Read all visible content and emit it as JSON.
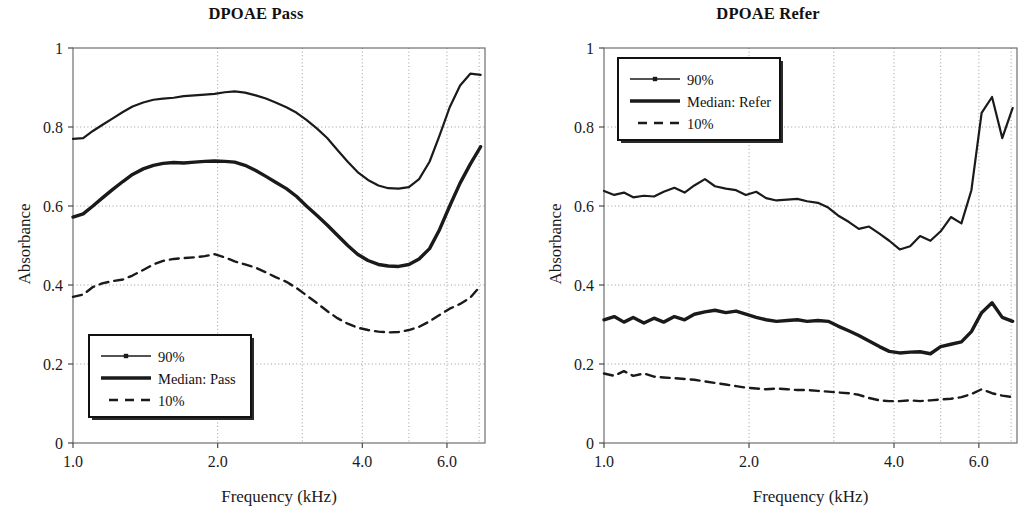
{
  "figure": {
    "width": 1025,
    "height": 512,
    "background": "#ffffff",
    "ink_color": "#1a1a1a",
    "grid_color": "#9a9a9a"
  },
  "panels": [
    {
      "id": "dpoae-pass",
      "title": "DPOAE Pass",
      "xlabel": "Frequency (kHz)",
      "ylabel": "Absorbance",
      "legend_position": "lower-left"
    },
    {
      "id": "dpoae-refer",
      "title": "DPOAE Refer",
      "xlabel": "Frequency (kHz)",
      "ylabel": "Absorbance",
      "legend_position": "upper-left"
    }
  ],
  "chart_data": [
    {
      "type": "line",
      "id": "dpoae-pass",
      "title": "DPOAE Pass",
      "xlabel": "Frequency (kHz)",
      "ylabel": "Absorbance",
      "xscale": "log",
      "xlim": [
        1.0,
        7.2
      ],
      "ylim": [
        0,
        1
      ],
      "xticks": [
        1.0,
        2.0,
        4.0,
        6.0
      ],
      "xticklabels": [
        "1.0",
        "2.0",
        "4.0",
        "6.0"
      ],
      "xgridlines": [
        2.0,
        3.0,
        4.0,
        5.0,
        6.0,
        7.0
      ],
      "yticks": [
        0,
        0.2,
        0.4,
        0.6,
        0.8,
        1
      ],
      "yticklabels": [
        "0",
        "0.2",
        "0.4",
        "0.6",
        "0.8",
        "1"
      ],
      "ygridlines": [
        0.2,
        0.4,
        0.6,
        0.8
      ],
      "grid": true,
      "legend": [
        {
          "label": "90%",
          "style": "solid-marker"
        },
        {
          "label": "Median: Pass",
          "style": "thick-solid"
        },
        {
          "label": "10%",
          "style": "dashed"
        }
      ],
      "x": [
        1.0,
        1.05,
        1.1,
        1.15,
        1.21,
        1.27,
        1.33,
        1.4,
        1.47,
        1.54,
        1.62,
        1.7,
        1.79,
        1.88,
        1.97,
        2.07,
        2.17,
        2.28,
        2.4,
        2.52,
        2.64,
        2.78,
        2.92,
        3.06,
        3.22,
        3.38,
        3.55,
        3.73,
        3.91,
        4.11,
        4.32,
        4.53,
        4.76,
        5.0,
        5.25,
        5.52,
        5.79,
        6.08,
        6.39,
        6.71,
        7.05
      ],
      "series": [
        {
          "name": "90%",
          "values": [
            0.77,
            0.772,
            0.79,
            0.805,
            0.822,
            0.838,
            0.852,
            0.862,
            0.869,
            0.872,
            0.874,
            0.878,
            0.88,
            0.882,
            0.884,
            0.888,
            0.89,
            0.887,
            0.88,
            0.872,
            0.862,
            0.85,
            0.836,
            0.818,
            0.796,
            0.772,
            0.742,
            0.712,
            0.686,
            0.666,
            0.652,
            0.645,
            0.644,
            0.648,
            0.668,
            0.712,
            0.778,
            0.85,
            0.905,
            0.935,
            0.932
          ]
        },
        {
          "name": "Median: Pass",
          "values": [
            0.572,
            0.58,
            0.6,
            0.62,
            0.642,
            0.662,
            0.68,
            0.694,
            0.703,
            0.708,
            0.71,
            0.709,
            0.711,
            0.713,
            0.714,
            0.713,
            0.711,
            0.703,
            0.69,
            0.675,
            0.66,
            0.644,
            0.624,
            0.6,
            0.576,
            0.552,
            0.526,
            0.5,
            0.478,
            0.462,
            0.452,
            0.448,
            0.447,
            0.452,
            0.466,
            0.492,
            0.54,
            0.6,
            0.658,
            0.706,
            0.75
          ]
        },
        {
          "name": "10%",
          "values": [
            0.37,
            0.376,
            0.395,
            0.404,
            0.41,
            0.414,
            0.424,
            0.438,
            0.452,
            0.461,
            0.466,
            0.468,
            0.47,
            0.473,
            0.478,
            0.47,
            0.46,
            0.452,
            0.444,
            0.432,
            0.42,
            0.408,
            0.392,
            0.374,
            0.354,
            0.334,
            0.316,
            0.302,
            0.292,
            0.286,
            0.282,
            0.28,
            0.281,
            0.286,
            0.294,
            0.308,
            0.324,
            0.34,
            0.352,
            0.368,
            0.398
          ]
        }
      ]
    },
    {
      "type": "line",
      "id": "dpoae-refer",
      "title": "DPOAE Refer",
      "xlabel": "Frequency (kHz)",
      "ylabel": "Absorbance",
      "xscale": "log",
      "xlim": [
        1.0,
        7.2
      ],
      "ylim": [
        0,
        1
      ],
      "xticks": [
        1.0,
        2.0,
        4.0,
        6.0
      ],
      "xticklabels": [
        "1.0",
        "2.0",
        "4.0",
        "6.0"
      ],
      "xgridlines": [
        2.0,
        3.0,
        4.0,
        5.0,
        6.0,
        7.0
      ],
      "yticks": [
        0,
        0.2,
        0.4,
        0.6,
        0.8,
        1
      ],
      "yticklabels": [
        "0",
        "0.2",
        "0.4",
        "0.6",
        "0.8",
        "1"
      ],
      "ygridlines": [
        0.2,
        0.4,
        0.6,
        0.8
      ],
      "grid": true,
      "legend": [
        {
          "label": "90%",
          "style": "solid-marker"
        },
        {
          "label": "Median: Refer",
          "style": "thick-solid"
        },
        {
          "label": "10%",
          "style": "dashed"
        }
      ],
      "x": [
        1.0,
        1.05,
        1.1,
        1.15,
        1.21,
        1.27,
        1.33,
        1.4,
        1.47,
        1.54,
        1.62,
        1.7,
        1.79,
        1.88,
        1.97,
        2.07,
        2.17,
        2.28,
        2.4,
        2.52,
        2.64,
        2.78,
        2.92,
        3.06,
        3.22,
        3.38,
        3.55,
        3.73,
        3.91,
        4.11,
        4.32,
        4.53,
        4.76,
        5.0,
        5.25,
        5.52,
        5.79,
        6.08,
        6.39,
        6.71,
        7.05
      ],
      "series": [
        {
          "name": "90%",
          "values": [
            0.638,
            0.628,
            0.634,
            0.622,
            0.626,
            0.624,
            0.636,
            0.646,
            0.634,
            0.652,
            0.668,
            0.65,
            0.644,
            0.64,
            0.628,
            0.636,
            0.62,
            0.614,
            0.616,
            0.618,
            0.612,
            0.608,
            0.596,
            0.576,
            0.56,
            0.542,
            0.548,
            0.53,
            0.512,
            0.49,
            0.498,
            0.524,
            0.512,
            0.536,
            0.572,
            0.556,
            0.64,
            0.836,
            0.876,
            0.772,
            0.848
          ]
        },
        {
          "name": "Median: Refer",
          "values": [
            0.312,
            0.32,
            0.306,
            0.318,
            0.304,
            0.316,
            0.306,
            0.32,
            0.312,
            0.326,
            0.332,
            0.336,
            0.33,
            0.334,
            0.326,
            0.318,
            0.312,
            0.308,
            0.31,
            0.312,
            0.308,
            0.31,
            0.308,
            0.296,
            0.284,
            0.272,
            0.258,
            0.244,
            0.232,
            0.228,
            0.23,
            0.231,
            0.226,
            0.244,
            0.25,
            0.256,
            0.282,
            0.33,
            0.355,
            0.318,
            0.308
          ]
        },
        {
          "name": "10%",
          "values": [
            0.176,
            0.17,
            0.182,
            0.17,
            0.176,
            0.168,
            0.166,
            0.164,
            0.162,
            0.16,
            0.156,
            0.152,
            0.148,
            0.144,
            0.14,
            0.138,
            0.136,
            0.138,
            0.136,
            0.134,
            0.134,
            0.132,
            0.13,
            0.128,
            0.126,
            0.122,
            0.114,
            0.108,
            0.106,
            0.106,
            0.108,
            0.106,
            0.108,
            0.11,
            0.112,
            0.116,
            0.124,
            0.136,
            0.126,
            0.12,
            0.116
          ]
        }
      ]
    }
  ]
}
